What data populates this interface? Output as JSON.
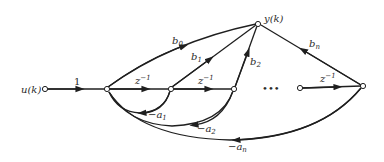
{
  "diagram": {
    "type": "signal-flow-graph",
    "nodes": {
      "input": {
        "label": "u(k)"
      },
      "output": {
        "label": "y(k)"
      },
      "ellipsis": "•••"
    },
    "edges": {
      "input_gain": "1",
      "delay1": "z",
      "delay2": "z",
      "delay_n": "z",
      "delay_exp": "−1",
      "b0": {
        "base": "b",
        "sub": "0"
      },
      "b1": {
        "base": "b",
        "sub": "1"
      },
      "b2": {
        "base": "b",
        "sub": "2"
      },
      "bn": {
        "base": "b",
        "sub": "n"
      },
      "a1": {
        "base": "−a",
        "sub": "1"
      },
      "a2": {
        "base": "−a",
        "sub": "2"
      },
      "an": {
        "base": "−a",
        "sub": "n"
      }
    },
    "colors": {
      "line": "#1f1f1f",
      "background": "#ffffff"
    }
  }
}
